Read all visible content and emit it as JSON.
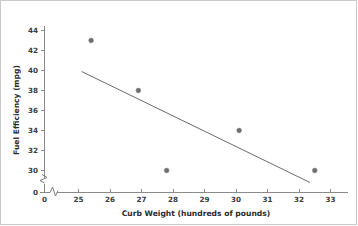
{
  "chart_data": {
    "type": "scatter",
    "title": "",
    "xlabel": "Curb Weight (hundreds of pounds)",
    "ylabel": "Fuel Efficiency (mpg)",
    "xlim": [
      24.6,
      33.6
    ],
    "ylim": [
      29.0,
      44.6
    ],
    "grid": false,
    "legend": null,
    "x_ticks": [
      "0",
      "25",
      "26",
      "27",
      "28",
      "29",
      "30",
      "31",
      "32",
      "33"
    ],
    "y_ticks": [
      "0",
      "30",
      "32",
      "34",
      "36",
      "38",
      "40",
      "42",
      "44"
    ],
    "x_axis_break": true,
    "y_axis_break": true,
    "points": [
      {
        "x": 25.4,
        "y": 43.0
      },
      {
        "x": 26.9,
        "y": 38.0
      },
      {
        "x": 27.8,
        "y": 30.0
      },
      {
        "x": 30.1,
        "y": 34.0
      },
      {
        "x": 32.5,
        "y": 30.0
      }
    ],
    "series": [
      {
        "name": "Observations",
        "x": [
          25.4,
          26.9,
          27.8,
          30.1,
          32.5
        ],
        "values": [
          43.0,
          38.0,
          30.0,
          34.0,
          30.0
        ]
      }
    ],
    "trend_line": {
      "name": "Least-squares line",
      "x_start": 25.1,
      "y_start": 39.9,
      "x_end": 32.35,
      "y_end": 28.8,
      "slope": -1.53,
      "intercept": 78.3
    },
    "colors": {
      "point": "#6e6e6e",
      "line": "#6b6b6b",
      "axis": "#8a8a8a",
      "text": "#2b2b2b",
      "background": "#ffffff",
      "border": "#c9c9c9"
    }
  }
}
